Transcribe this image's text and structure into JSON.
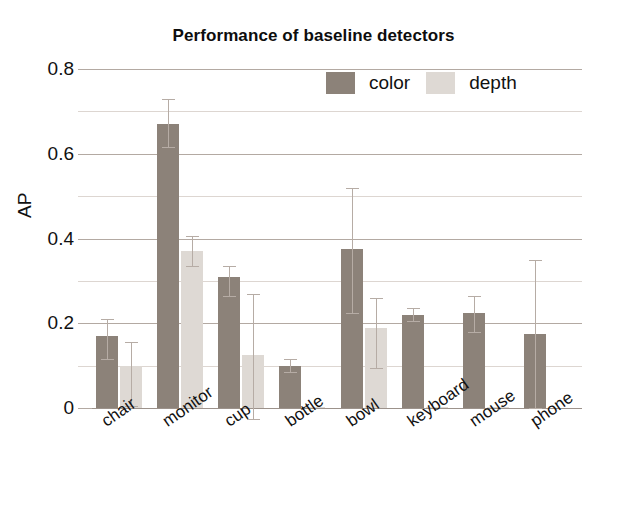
{
  "chart_data": {
    "type": "bar",
    "title": "Performance of baseline detectors",
    "xlabel": "",
    "ylabel": "AP",
    "ylim": [
      0,
      0.8
    ],
    "yticks": [
      "0",
      "0.2",
      "0.4",
      "0.6",
      "0.8"
    ],
    "ytick_values": [
      0,
      0.2,
      0.4,
      0.6,
      0.8
    ],
    "minor_gridlines": [
      0.1,
      0.3,
      0.5,
      0.7
    ],
    "grid": true,
    "legend_position": "top-right inside",
    "categories": [
      "chair",
      "monitor",
      "cup",
      "bottle",
      "bowl",
      "keyboard",
      "mouse",
      "phone"
    ],
    "series": [
      {
        "name": "color",
        "color": "#8c8279",
        "values": [
          0.17,
          0.67,
          0.31,
          0.1,
          0.375,
          0.22,
          0.225,
          0.175
        ],
        "err_low": [
          0.055,
          0.055,
          0.045,
          0.015,
          0.15,
          0.015,
          0.045,
          0.175
        ],
        "err_high": [
          0.04,
          0.06,
          0.025,
          0.015,
          0.145,
          0.015,
          0.04,
          0.175
        ]
      },
      {
        "name": "depth",
        "color": "#ded9d4",
        "values": [
          0.1,
          0.37,
          0.125,
          0.003,
          0.19,
          0.003,
          0.002,
          0.0
        ],
        "err_low": [
          0.095,
          0.035,
          0.15,
          0.0,
          0.095,
          0.0,
          0.0,
          0.0
        ],
        "err_high": [
          0.055,
          0.035,
          0.145,
          0.0,
          0.07,
          0.0,
          0.0,
          0.0
        ]
      }
    ]
  },
  "legend": {
    "entries": [
      {
        "label": "color",
        "swatch": "color"
      },
      {
        "label": "depth",
        "swatch": "depth"
      }
    ]
  },
  "axis": {
    "y_label": "AP",
    "y_ticks": [
      "0.8",
      "0.6",
      "0.4",
      "0.2",
      "0"
    ]
  }
}
